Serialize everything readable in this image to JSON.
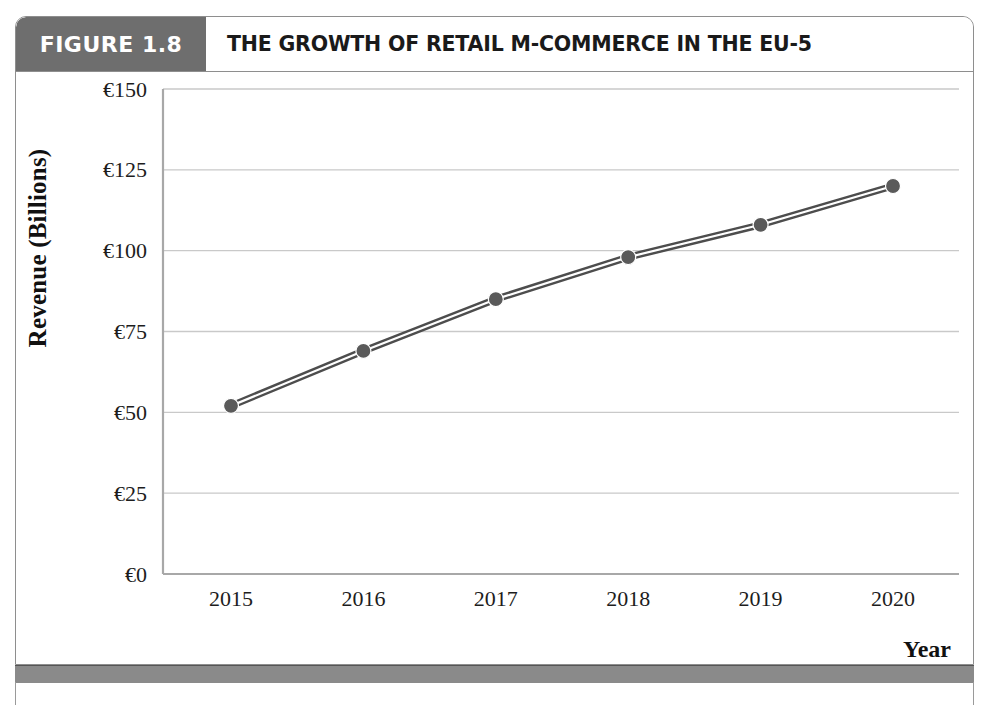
{
  "figure": {
    "tag_label": "FIGURE 1.8",
    "title": "THE GROWTH OF RETAIL M-COMMERCE IN THE EU-5",
    "tag_bg_color": "#6e6e6e",
    "tag_text_color": "#ffffff",
    "frame_border_color": "#8e8e8e",
    "bottom_bar_color": "#8a8a8a"
  },
  "chart_data": {
    "type": "line",
    "title": "THE GROWTH OF RETAIL M-COMMERCE IN THE EU-5",
    "subtitle": "",
    "xlabel": "Year",
    "ylabel": "Revenue (Billions)",
    "categories": [
      "2015",
      "2016",
      "2017",
      "2018",
      "2019",
      "2020"
    ],
    "values": [
      52,
      69,
      85,
      98,
      108,
      120
    ],
    "series": [
      {
        "name": "Retail m-commerce revenue",
        "values": [
          52,
          69,
          85,
          98,
          108,
          120
        ],
        "line_color": "#4d4d4d",
        "marker_color": "#5a5a5a",
        "marker": "circle",
        "style": "double-stroke"
      }
    ],
    "ylim": [
      0,
      150
    ],
    "ytick_values": [
      0,
      25,
      50,
      75,
      100,
      125,
      150
    ],
    "ytick_labels": [
      "€0",
      "€25",
      "€50",
      "€75",
      "€100",
      "€125",
      "€150"
    ],
    "xtick_labels": [
      "2015",
      "2016",
      "2017",
      "2018",
      "2019",
      "2020"
    ],
    "grid": "horizontal",
    "grid_color": "#c9c9c9",
    "axis_color": "#a8a8a8",
    "legend": "none",
    "legend_position": "none",
    "currency_symbol": "€",
    "units": "Billions"
  }
}
